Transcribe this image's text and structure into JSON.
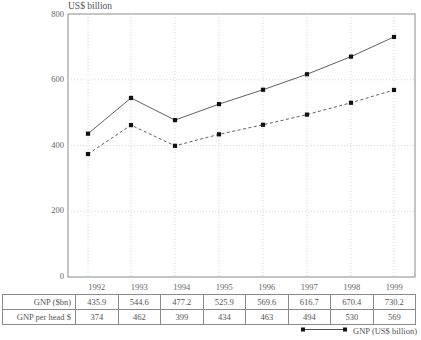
{
  "chart_data": {
    "type": "line",
    "title": "",
    "axis_title": "US$ billion",
    "xlabel": "",
    "ylabel": "US$ billion",
    "grid": true,
    "ylim": [
      0,
      800
    ],
    "yticks": [
      0,
      200,
      400,
      600,
      800
    ],
    "ytick_labels": [
      "0",
      "200",
      "400",
      "600",
      "800"
    ],
    "categories": [
      "1992",
      "1993",
      "1994",
      "1995",
      "1996",
      "1997",
      "1998",
      "1999"
    ],
    "legend_position": "bottom-right",
    "series": [
      {
        "name": "GNP (US$ billion)",
        "style": "solid",
        "marker": "square",
        "values": [
          435.9,
          544.6,
          477.2,
          525.9,
          569.6,
          616.7,
          670.4,
          730.2
        ]
      },
      {
        "name": "GNP per head $",
        "style": "dashed",
        "marker": "square",
        "values": [
          374,
          462,
          399,
          434,
          463,
          494,
          530,
          569
        ]
      }
    ]
  },
  "table": {
    "header": [
      "",
      "1992",
      "1993",
      "1994",
      "1995",
      "1996",
      "1997",
      "1998",
      "1999"
    ],
    "rows": [
      {
        "label": "GNP ($bn)",
        "values": [
          "435.9",
          "544.6",
          "477.2",
          "525.9",
          "569.6",
          "616.7",
          "670.4",
          "730.2"
        ]
      },
      {
        "label": "GNP per head $",
        "values": [
          "374",
          "462",
          "399",
          "434",
          "463",
          "494",
          "530",
          "569"
        ]
      }
    ]
  },
  "legend": {
    "label": "GNP (US$ billion)"
  },
  "colors": {
    "line": "#4d4d4d",
    "marker": "#111111",
    "grid": "#d6d6d6",
    "frame": "#8a8a8a",
    "text": "#555555"
  }
}
